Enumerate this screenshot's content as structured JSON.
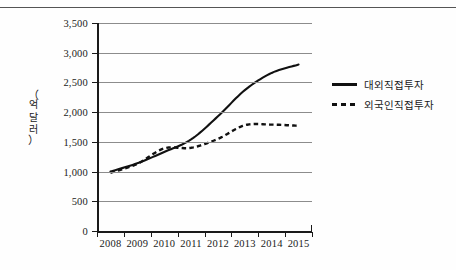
{
  "chart_data": {
    "type": "line",
    "title": "",
    "xlabel": "",
    "ylabel": "(억 달러)",
    "ylabel_chars": [
      "억",
      "달",
      "러"
    ],
    "x": [
      "2008",
      "2009",
      "2010",
      "2011",
      "2012",
      "2013",
      "2014",
      "2015"
    ],
    "categories": [
      "2008",
      "2009",
      "2010",
      "2011",
      "2012",
      "2013",
      "2014",
      "2015"
    ],
    "ylim": [
      0,
      3500
    ],
    "ytick_values": [
      0,
      500,
      1000,
      1500,
      2000,
      2500,
      3000,
      3500
    ],
    "ytick_labels": [
      "0",
      "500",
      "1,000",
      "1,500",
      "2,000",
      "2,500",
      "3,000",
      "3,500"
    ],
    "grid": true,
    "legend_position": "right",
    "series": [
      {
        "name": "대외직접투자",
        "style": "solid",
        "color": "#111111",
        "values": [
          1000,
          1140,
          1330,
          1540,
          1930,
          2370,
          2660,
          2800
        ]
      },
      {
        "name": "외국인직접투자",
        "style": "dashed",
        "color": "#111111",
        "values": [
          980,
          1130,
          1390,
          1400,
          1550,
          1780,
          1790,
          1770
        ]
      }
    ]
  },
  "legend": {
    "entries": [
      {
        "label": "대외직접투자",
        "key": "solid-line-key"
      },
      {
        "label": "외국인직접투자",
        "key": "dashed-line-key"
      }
    ]
  }
}
